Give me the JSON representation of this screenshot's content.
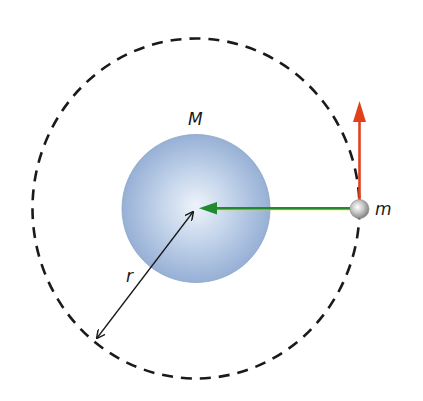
{
  "diagram": {
    "type": "circular-orbit",
    "labels": {
      "central_mass": "M",
      "orbiting_mass": "m",
      "radius": "r"
    },
    "colors": {
      "orbit": "#1a1a1a",
      "central_body": "#9db5d9",
      "central_body_highlight": "#e6eef8",
      "orbiting_body": "#b0b0b0",
      "velocity_arrow": "#e0401c",
      "force_arrow": "#1f8a2e",
      "force_arrow_edge": "#d8d23a",
      "radius_arrow": "#1a1a1a"
    },
    "elements": [
      {
        "id": "orbit-path",
        "kind": "dashed-circle",
        "center": [
          196,
          208
        ],
        "radius": 166
      },
      {
        "id": "central-body",
        "kind": "sphere",
        "center": [
          196,
          208
        ],
        "radius": 74,
        "label": "M"
      },
      {
        "id": "orbiting-body",
        "kind": "sphere",
        "center": [
          359,
          209
        ],
        "radius": 10,
        "label": "m"
      },
      {
        "id": "velocity-vector",
        "kind": "arrow",
        "from": [
          359,
          199
        ],
        "to": [
          359,
          103
        ],
        "direction": "up"
      },
      {
        "id": "gravity-force-vector",
        "kind": "arrow",
        "from": [
          349,
          209
        ],
        "to": [
          199,
          208
        ],
        "direction": "toward center"
      },
      {
        "id": "radius-dimension",
        "kind": "double-arrow",
        "from": [
          194,
          211
        ],
        "to": [
          96,
          339
        ],
        "label": "r"
      }
    ]
  }
}
